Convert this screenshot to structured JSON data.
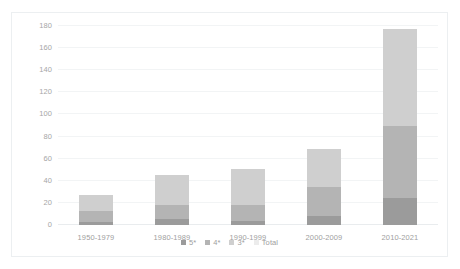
{
  "top_partial_text": "",
  "chart_data": {
    "type": "bar",
    "subtype": "stacked",
    "title": "",
    "xlabel": "",
    "ylabel": "",
    "ylim": [
      0,
      180
    ],
    "ytick_step": 20,
    "yticks": [
      180,
      160,
      140,
      120,
      100,
      80,
      60,
      40,
      20,
      0
    ],
    "ytick_labels": [
      "180",
      "160",
      "140",
      "120",
      "100",
      "80",
      "60",
      "40",
      "20",
      "0"
    ],
    "grid": true,
    "grid_axis": "y",
    "legend_position": "bottom",
    "categories": [
      "1950-1979",
      "1980-1989",
      "1990-1999",
      "2000-2009",
      "2010-2021"
    ],
    "series": [
      {
        "name": "5*",
        "color": "#9b9b9b",
        "values": [
          3,
          5,
          4,
          8,
          24
        ]
      },
      {
        "name": "4*",
        "color": "#b4b4b4",
        "values": [
          10,
          13,
          14,
          26,
          66
        ]
      },
      {
        "name": "3*",
        "color": "#cfcfcf",
        "values": [
          14,
          27,
          33,
          35,
          87
        ]
      },
      {
        "name": "Total",
        "color": "#ececec",
        "values": [
          27,
          45,
          51,
          69,
          171
        ]
      }
    ],
    "stack_order": [
      "5*",
      "4*",
      "3*",
      "Total"
    ],
    "stacked_totals": [
      27,
      45,
      51,
      69,
      171
    ],
    "note": "Total series is drawn as the topmost stacked segment, sized as total minus the 5*+4*+3* segments."
  },
  "legend": {
    "items": [
      {
        "label": "5*",
        "color": "#9b9b9b"
      },
      {
        "label": "4*",
        "color": "#b4b4b4"
      },
      {
        "label": "3*",
        "color": "#cfcfcf"
      },
      {
        "label": "Total",
        "color": "#ececec"
      }
    ]
  }
}
